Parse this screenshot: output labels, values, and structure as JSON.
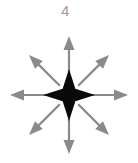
{
  "figure": {
    "label": "4",
    "label_color": "#9a9a9a",
    "background_color": "#ffffff",
    "center_shape": {
      "name": "four-pointed-star",
      "fill_color": "#0a0a0a",
      "center_x": 69,
      "center_y": 95,
      "point_radius": 26,
      "waist_radius": 9
    },
    "arrows": {
      "count": 8,
      "color": "#8a8a8a",
      "shaft_width": 2.2,
      "head_length": 14,
      "head_width": 11,
      "start_radius": 13,
      "cardinal_length": 59,
      "diagonal_length": 56,
      "directions": [
        {
          "name": "arrow-up",
          "angle_deg": 90,
          "tip_x": 69,
          "tip_y": 36
        },
        {
          "name": "arrow-up-right",
          "angle_deg": 45,
          "tip_x": 109,
          "tip_y": 55
        },
        {
          "name": "arrow-right",
          "angle_deg": 0,
          "tip_x": 128,
          "tip_y": 95
        },
        {
          "name": "arrow-down-right",
          "angle_deg": -45,
          "tip_x": 109,
          "tip_y": 135
        },
        {
          "name": "arrow-down",
          "angle_deg": -90,
          "tip_x": 69,
          "tip_y": 154
        },
        {
          "name": "arrow-down-left",
          "angle_deg": -135,
          "tip_x": 29,
          "tip_y": 135
        },
        {
          "name": "arrow-left",
          "angle_deg": 180,
          "tip_x": 10,
          "tip_y": 95
        },
        {
          "name": "arrow-up-left",
          "angle_deg": 135,
          "tip_x": 29,
          "tip_y": 55
        }
      ]
    }
  }
}
